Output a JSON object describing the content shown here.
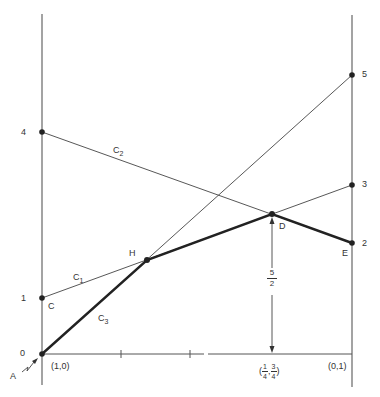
{
  "diagram": {
    "left_axis_ticks": [
      {
        "label": "4",
        "value": 4
      },
      {
        "label": "1",
        "value": 1
      },
      {
        "label": "0",
        "value": 0
      }
    ],
    "right_axis_ticks": [
      {
        "label": "5",
        "value": 5
      },
      {
        "label": "3",
        "value": 3
      },
      {
        "label": "2",
        "value": 2
      }
    ],
    "x_axis_labels": {
      "left": "(1,0)",
      "mid_open": "(",
      "mid_num1": "1",
      "mid_den1": "4",
      "mid_sep": ",",
      "mid_num2": "3",
      "mid_den2": "4",
      "mid_close": ")",
      "right": "(0,1)"
    },
    "points": {
      "A": "A",
      "C": "C",
      "H": "H",
      "D": "D",
      "E": "E"
    },
    "curves": {
      "C1": {
        "base": "C",
        "sub": "1"
      },
      "C2": {
        "base": "C",
        "sub": "2"
      },
      "C3": {
        "base": "C",
        "sub": "3"
      }
    },
    "height_annotation": {
      "numerator": "5",
      "denominator": "2"
    },
    "lines": [
      {
        "name": "C1",
        "from": [
          0,
          1
        ],
        "to": [
          1,
          3
        ]
      },
      {
        "name": "C2",
        "from": [
          0,
          4
        ],
        "to": [
          1,
          2
        ]
      },
      {
        "name": "C3",
        "from": [
          0,
          0
        ],
        "to": [
          1,
          5
        ]
      }
    ],
    "lower_envelope": [
      "A(0)",
      "H",
      "D(5/2)",
      "E(2)"
    ],
    "colors": {
      "line": "#333333",
      "axis": "#555555",
      "thick": "#222222"
    }
  }
}
